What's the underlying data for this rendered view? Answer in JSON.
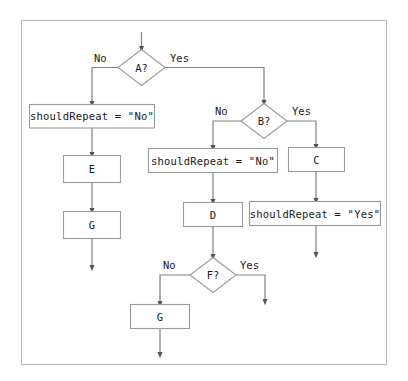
{
  "diagram": {
    "type": "flowchart",
    "title": "",
    "frame": {
      "border_color": "#b9b9b9",
      "background": "#ffffff"
    },
    "node_style": {
      "stroke": "#9a9a9a",
      "fill": "#ffffff",
      "text_color": "#1a1a1a"
    },
    "edge_style": {
      "stroke": "#808080",
      "arrow": "solid-triangle"
    },
    "nodes": [
      {
        "id": "start",
        "shape": "arrow-entry",
        "label": ""
      },
      {
        "id": "a",
        "shape": "diamond",
        "label": "A?"
      },
      {
        "id": "set_no_left",
        "shape": "rect",
        "label": "shouldRepeat = \"No\""
      },
      {
        "id": "e",
        "shape": "rect",
        "label": "E"
      },
      {
        "id": "g_left",
        "shape": "rect",
        "label": "G"
      },
      {
        "id": "b",
        "shape": "diamond",
        "label": "B?"
      },
      {
        "id": "set_no_mid",
        "shape": "rect",
        "label": "shouldRepeat = \"No\""
      },
      {
        "id": "c",
        "shape": "rect",
        "label": "C"
      },
      {
        "id": "d",
        "shape": "rect",
        "label": "D"
      },
      {
        "id": "set_yes",
        "shape": "rect",
        "label": "shouldRepeat = \"Yes\""
      },
      {
        "id": "f",
        "shape": "diamond",
        "label": "F?"
      },
      {
        "id": "g_bottom",
        "shape": "rect",
        "label": "G"
      }
    ],
    "edge_labels": [
      {
        "id": "a-no",
        "text": "No",
        "from": "a"
      },
      {
        "id": "a-yes",
        "text": "Yes",
        "from": "a"
      },
      {
        "id": "b-no",
        "text": "No",
        "from": "b"
      },
      {
        "id": "b-yes",
        "text": "Yes",
        "from": "b"
      },
      {
        "id": "f-no",
        "text": "No",
        "from": "f"
      },
      {
        "id": "f-yes",
        "text": "Yes",
        "from": "f"
      }
    ]
  }
}
